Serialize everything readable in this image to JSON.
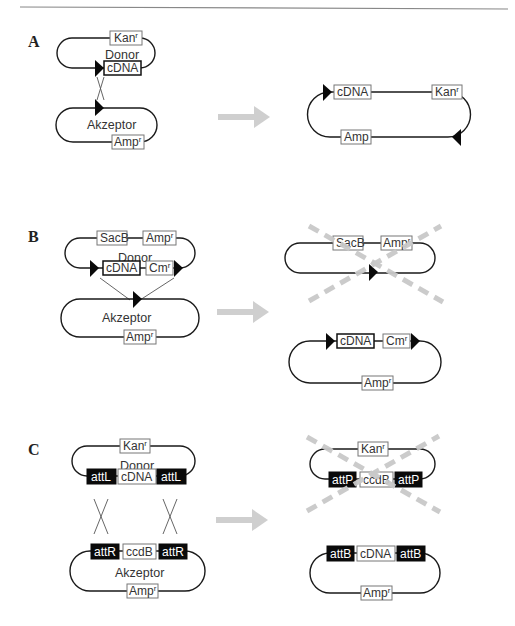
{
  "header": {
    "rule_visible": true
  },
  "panels": {
    "A": {
      "label": "A",
      "donor": {
        "name": "Donor",
        "top_marker": "Kan",
        "top_sup": "r",
        "bottom_marker": "cDNA"
      },
      "acceptor": {
        "name": "Akzeptor",
        "bottom_marker": "Amp",
        "bottom_sup": "r"
      },
      "result": {
        "top_left": "cDNA",
        "top_right": "Kan",
        "top_right_sup": "r",
        "bottom": "Amp"
      }
    },
    "B": {
      "label": "B",
      "donor": {
        "name": "Donor",
        "top_left": "SacB",
        "top_right": "Amp",
        "top_right_sup": "r",
        "bottom_left": "cDNA",
        "bottom_right": "Cm",
        "bottom_right_sup": "r"
      },
      "acceptor": {
        "name": "Akzeptor",
        "bottom_marker": "Amp",
        "bottom_sup": "r"
      },
      "result_discarded": {
        "top_left": "SacB",
        "top_right": "Amp",
        "top_right_sup": "r"
      },
      "result": {
        "top_left": "cDNA",
        "top_right": "Cm",
        "top_right_sup": "r",
        "bottom": "Amp",
        "bottom_sup": "r"
      }
    },
    "C": {
      "label": "C",
      "donor": {
        "name": "Donor",
        "top_marker": "Kan",
        "top_sup": "r",
        "left_site": "attL",
        "center": "cDNA",
        "right_site": "attL"
      },
      "acceptor": {
        "name": "Akzeptor",
        "left_site": "attR",
        "center": "ccdB",
        "right_site": "attR",
        "bottom_marker": "Amp",
        "bottom_sup": "r"
      },
      "result_discarded": {
        "top_marker": "Kan",
        "top_sup": "r",
        "left_site": "attP",
        "center": "ccdB",
        "right_site": "attP"
      },
      "result": {
        "left_site": "attB",
        "center": "cDNA",
        "right_site": "attB",
        "bottom_marker": "Amp",
        "bottom_sup": "r"
      }
    }
  },
  "colors": {
    "line": "#1a1a1a",
    "arrow": "#cfcfcf",
    "discard_cross": "#c8c8c8",
    "site_fill": "#0a0a0a"
  }
}
